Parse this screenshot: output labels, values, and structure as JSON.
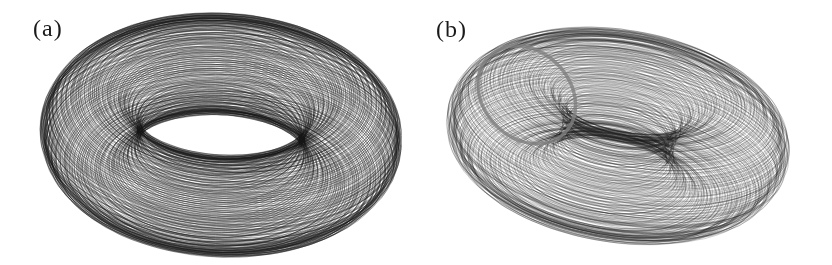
{
  "page": {
    "background": "#ffffff",
    "ink_color": "#1b1b1b"
  },
  "figure": {
    "kind": "two-panel phase-space attractor figure, scanned print style, no axes or captions visible"
  },
  "chart_data": [
    {
      "type": "line",
      "subtype": "quasiperiodic-torus-attractor",
      "title": "(a)",
      "description": "Dense black trajectory winding quasi-periodically over the surface of a tilted torus; orthographic projection; outer rim nearly solid black, interior shows fine nested line weave with two white lens-shaped holes split by a dark fold band; no axes, gridlines or tick labels shown",
      "legend": null,
      "axes": null,
      "params": {
        "center_x": 221,
        "center_y": 135,
        "scale": 130,
        "major_radius": 1.0,
        "tube_radius": 0.375,
        "tilt_deg": 57,
        "roll_deg": 3,
        "shear_x": 0,
        "freq_ratio": 0.10457,
        "loops": 270,
        "segments_per_loop": 120,
        "wobble": 0.05,
        "jitter": 0.45,
        "stroke": "rgba(22,22,22,0.50)",
        "line_width": 0.65
      }
    },
    {
      "type": "line",
      "subtype": "quasiperiodic-torus-attractor",
      "title": "(b)",
      "description": "Quasi-periodic trajectory on a sheared tilted torus; lighter, finer nested loops than panel (a); bottom-right shows an offset lobe of nested thin ellipses where the tube folds out; a gray cross-section marker band crosses the torus surface at upper left; no axes, gridlines or tick labels shown",
      "legend": null,
      "axes": null,
      "params": {
        "center_x": 618,
        "center_y": 136,
        "scale": 100,
        "major_radius": 1.0,
        "tube_radius": 0.52,
        "tilt_deg": 56,
        "roll_deg": -4,
        "shear_x": 0.5,
        "freq_ratio": 0.0787,
        "loops": 280,
        "segments_per_loop": 120,
        "wobble": 0.07,
        "jitter": 0.4,
        "stroke": "rgba(28,28,28,0.40)",
        "line_width": 0.55
      },
      "section_marker": {
        "name": "poincare-section-band",
        "theta_deg": 238,
        "color": "rgba(128,128,128,0.8)",
        "line_width": 3.5
      }
    }
  ]
}
